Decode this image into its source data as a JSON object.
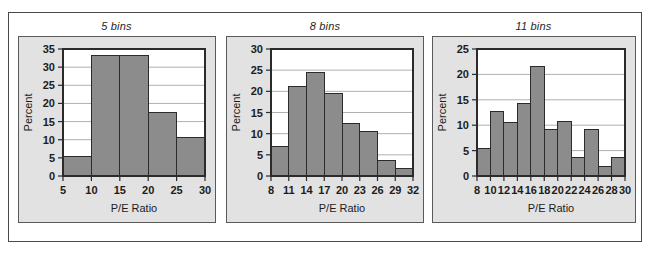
{
  "figure": {
    "panel_count": 3,
    "bar_fill_color": "#8c8c8c",
    "bar_stroke_color": "#2b2b2b",
    "panel_bg_color": "#e2e2e2",
    "plot_bg_color": "#ffffff",
    "grid_color": "#b0b0b0",
    "frame_color": "#4a4a4a"
  },
  "chart_data": [
    {
      "type": "bar",
      "title": "5 bins",
      "xlabel": "P/E Ratio",
      "ylabel": "Percent",
      "xticks": [
        5,
        10,
        15,
        20,
        25,
        30
      ],
      "yticks": [
        0,
        5,
        10,
        15,
        20,
        25,
        30,
        35
      ],
      "xlim": [
        5,
        30
      ],
      "ylim": [
        0,
        35
      ],
      "grid": true,
      "bin_edges": [
        5,
        10,
        15,
        20,
        25,
        30
      ],
      "values": [
        5.3,
        33.2,
        33.2,
        17.6,
        10.6
      ],
      "categories": [
        "5-10",
        "10-15",
        "15-20",
        "20-25",
        "25-30"
      ]
    },
    {
      "type": "bar",
      "title": "8 bins",
      "xlabel": "P/E Ratio",
      "ylabel": "Percent",
      "xticks": [
        8,
        11,
        14,
        17,
        20,
        23,
        26,
        29,
        32
      ],
      "yticks": [
        0,
        5,
        10,
        15,
        20,
        25,
        30
      ],
      "xlim": [
        8,
        32
      ],
      "ylim": [
        0,
        30
      ],
      "grid": true,
      "bin_edges": [
        8,
        11,
        14,
        17,
        20,
        23,
        26,
        29,
        32
      ],
      "values": [
        7.0,
        21.1,
        24.4,
        19.4,
        12.4,
        10.6,
        3.6,
        1.8
      ],
      "categories": [
        "8-11",
        "11-14",
        "14-17",
        "17-20",
        "20-23",
        "23-26",
        "26-29",
        "29-32"
      ]
    },
    {
      "type": "bar",
      "title": "11 bins",
      "xlabel": "P/E Ratio",
      "ylabel": "Percent",
      "xticks": [
        8,
        10,
        12,
        14,
        16,
        18,
        20,
        22,
        24,
        26,
        28,
        30
      ],
      "yticks": [
        0,
        5,
        10,
        15,
        20,
        25
      ],
      "xlim": [
        8,
        30
      ],
      "ylim": [
        0,
        25
      ],
      "grid": true,
      "bin_edges": [
        8,
        10,
        12,
        14,
        16,
        18,
        20,
        22,
        24,
        26,
        28,
        30
      ],
      "values": [
        5.4,
        12.6,
        10.6,
        14.3,
        21.6,
        9.1,
        10.7,
        3.6,
        9.1,
        1.9,
        3.6
      ],
      "categories": [
        "8-10",
        "10-12",
        "12-14",
        "14-16",
        "16-18",
        "18-20",
        "20-22",
        "22-24",
        "24-26",
        "26-28",
        "28-30"
      ]
    }
  ]
}
